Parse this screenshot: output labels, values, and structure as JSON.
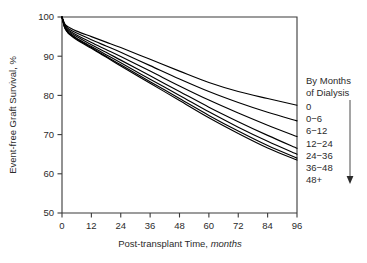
{
  "chart_data": {
    "type": "line",
    "title": "",
    "subtitle": "",
    "xlabel_main": "Post-transplant Time,",
    "xlabel_italic": "months",
    "ylabel": "Event-free Graft Survival, %",
    "xlim": [
      0,
      96
    ],
    "ylim": [
      50,
      100
    ],
    "grid": false,
    "legend_position": "right",
    "x_ticks": [
      "0",
      "12",
      "24",
      "36",
      "48",
      "60",
      "72",
      "84",
      "96"
    ],
    "x_tick_values": [
      0,
      12,
      24,
      36,
      48,
      60,
      72,
      84,
      96
    ],
    "y_ticks": [
      "50",
      "60",
      "70",
      "80",
      "90",
      "100"
    ],
    "y_tick_values": [
      50,
      60,
      70,
      80,
      90,
      100
    ],
    "x": [
      0,
      1,
      2,
      3,
      6,
      12,
      18,
      24,
      36,
      48,
      60,
      72,
      84,
      96
    ],
    "series": [
      {
        "name": "0",
        "values": [
          100,
          98.4,
          97.7,
          97.3,
          96.4,
          95.0,
          93.6,
          92.2,
          89.2,
          86.2,
          83.3,
          81.0,
          79.2,
          77.5
        ]
      },
      {
        "name": "0-6",
        "values": [
          100,
          98.2,
          97.4,
          96.9,
          95.9,
          94.2,
          92.6,
          91.0,
          87.6,
          84.2,
          81.0,
          78.2,
          75.7,
          73.5
        ]
      },
      {
        "name": "6-12",
        "values": [
          100,
          98.0,
          97.1,
          96.5,
          95.4,
          93.5,
          91.7,
          89.9,
          86.2,
          82.4,
          78.8,
          75.5,
          72.4,
          69.5
        ]
      },
      {
        "name": "12-24",
        "values": [
          100,
          97.8,
          96.8,
          96.2,
          95.0,
          92.9,
          91.0,
          89.0,
          85.0,
          81.0,
          77.0,
          73.3,
          69.8,
          66.5
        ]
      },
      {
        "name": "24-36",
        "values": [
          100,
          97.6,
          96.6,
          95.9,
          94.6,
          92.5,
          90.4,
          88.3,
          84.1,
          80.0,
          75.8,
          71.9,
          68.3,
          65.0
        ]
      },
      {
        "name": "36-48",
        "values": [
          100,
          97.5,
          96.4,
          95.7,
          94.4,
          92.2,
          90.0,
          87.8,
          83.5,
          79.2,
          74.9,
          70.9,
          67.2,
          64.0
        ]
      },
      {
        "name": "48+",
        "values": [
          100,
          97.4,
          96.3,
          95.6,
          94.2,
          92.0,
          89.8,
          87.5,
          83.1,
          78.7,
          74.3,
          70.3,
          66.6,
          63.5
        ]
      }
    ]
  },
  "legend": {
    "header_line1": "By Months",
    "header_line2": "of Dialysis",
    "entries": [
      "0",
      "0−6",
      "6−12",
      "12−24",
      "24−36",
      "36−48",
      "48+"
    ],
    "arrow_icon": "down-arrow-icon"
  },
  "colors": {
    "curve": "#000000",
    "axis": "#3a3a3a",
    "text": "#2b2b2b",
    "background": "#ffffff"
  }
}
